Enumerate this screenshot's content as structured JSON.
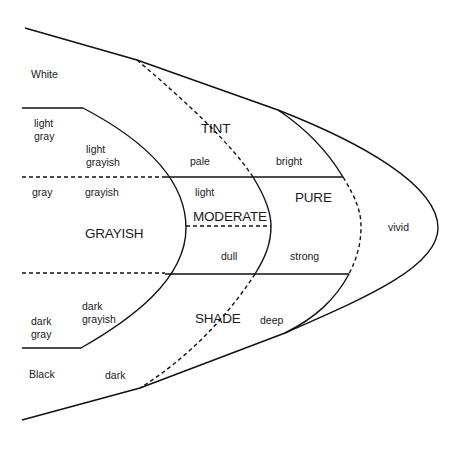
{
  "diagram": {
    "type": "color-tone-diagram",
    "regions": {
      "tint": "TINT",
      "moderate": "MODERATE",
      "grayish": "GRAYISH",
      "shade": "SHADE",
      "pure": "PURE"
    },
    "achromatic": {
      "white": "White",
      "light_gray": "light\ngray",
      "gray": "gray",
      "dark_gray": "dark\ngray",
      "black": "Black"
    },
    "tones": {
      "light_grayish": "light\ngrayish",
      "grayish": "grayish",
      "dark_grayish": "dark\ngrayish",
      "pale": "pale",
      "light": "light",
      "dull": "dull",
      "dark": "dark",
      "bright": "bright",
      "strong": "strong",
      "deep": "deep",
      "vivid": "vivid"
    },
    "colors": {
      "line": "#111111",
      "text": "#1a1a1a",
      "background": "#ffffff"
    }
  }
}
